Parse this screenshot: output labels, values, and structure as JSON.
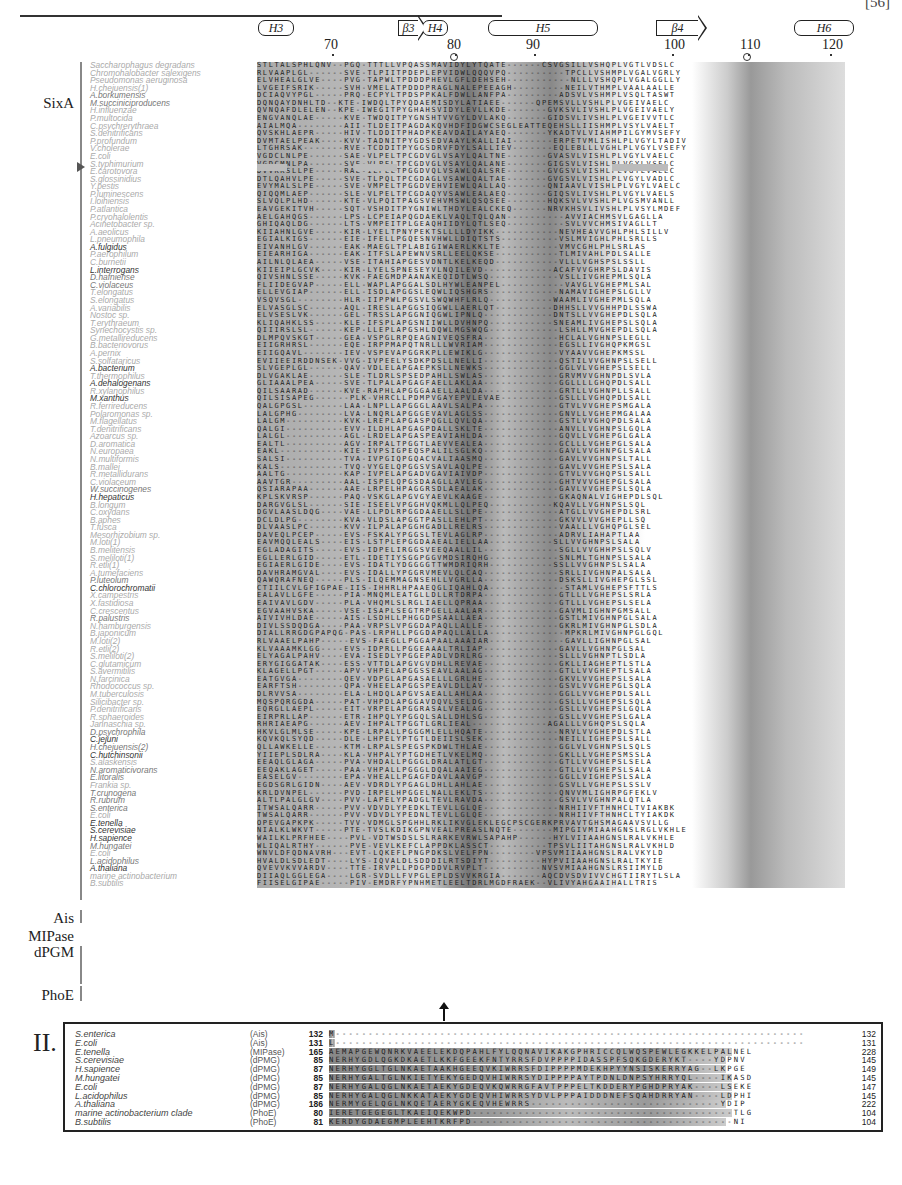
{
  "header": {
    "journal_code": "[56]"
  },
  "secondary_structure": [
    {
      "label": "H3",
      "type": "helix",
      "x": 258,
      "w": 36
    },
    {
      "label": "β3",
      "type": "strand",
      "x": 398,
      "w": 20
    },
    {
      "label": "H4",
      "type": "helix",
      "x": 422,
      "w": 26
    },
    {
      "label": "H5",
      "type": "helix",
      "x": 488,
      "w": 110
    },
    {
      "label": "β4",
      "type": "strand",
      "x": 656,
      "w": 42
    },
    {
      "label": "H6",
      "type": "helix",
      "x": 794,
      "w": 60
    }
  ],
  "ruler": [
    {
      "label": "70",
      "x": 332
    },
    {
      "label": "80",
      "x": 455
    },
    {
      "label": "90",
      "x": 534
    },
    {
      "label": "100",
      "x": 672
    },
    {
      "label": "110",
      "x": 748
    },
    {
      "label": "120",
      "x": 830
    }
  ],
  "markers": {
    "ring_positions": [
      452,
      745
    ],
    "highlight_row_species": "E.coli",
    "arrow_position": "between panels at residue ~80"
  },
  "groups": [
    {
      "label": "SixA",
      "top": 95
    },
    {
      "label": "Ais",
      "top": 910
    },
    {
      "label": "MIPase",
      "top": 928
    },
    {
      "label": "dPGM",
      "top": 944
    },
    {
      "label": "PhoE",
      "top": 987
    }
  ],
  "species": [
    {
      "name": "Saccharophagus degradans",
      "tone": "lt",
      "seq": "STLTALSPHLQNV--PGQ-TTTLLVPQASSMAVIDYLYTQATE------CSVGSILLVSHQPLVGTLVDSLC"
    },
    {
      "name": "Chromohalobacter salexigens",
      "tone": "lt",
      "seq": "RLVAAPLGL------SVE-TLPIITPDEPLEPVIDWLQQQVPQ----------TPCLLVSHMPLVGALVGRLY"
    },
    {
      "name": "Pseudomonas aeruginosa",
      "tone": "lt",
      "seq": "ELVHEALGLVE----PVG-TAPWLTPDDDPHEVLGFLDEHSEH-----------NLLLVSHQPLVGALGGLLY"
    },
    {
      "name": "H.chejuensis(1)",
      "tone": "lt",
      "seq": "LVGEIFSRIK-----SVH-VMELATPDDDPRAGLNALEPEEAGH---------NEILVTHMPLVAALAALLE"
    },
    {
      "name": "A.borkumensis",
      "tone": "md",
      "seq": "DCIAQVYPGL-----PRQ-ECPYLTPDSPPKALFDWLLANFPA---------ADSVLVSHMPLVSQLTASWT"
    },
    {
      "name": "M.succiniciproducens",
      "tone": "md",
      "seq": "DQNQAYDNHLTD--KTE-IWDQLTPYQDAEMISDYLATIAEE------QPEMSVLLVSHLPLVGEIVAELC"
    },
    {
      "name": "H.influenzae",
      "tone": "lt",
      "seq": "QVNQAFDLELEN--KPE-IWEGITPYGHAHSVIDYLEVLLKDE-------GVKSVLIVSHLPLVGEIVAELY"
    },
    {
      "name": "P.multocida",
      "tone": "lt",
      "seq": "ENGVANQLAE-----KVE-TWDQITPYGNSHTVVGYLDVLAKQ-------GIDSVLIVSHLPLVGEIVVTLC"
    },
    {
      "name": "C.psychrerythraea",
      "tone": "lt",
      "seq": "AIALMQA--------AII-TLDEITPAGDAKQVHDFIDGWCSEGLEATTEQEHSLLIISHMPLVSYLVAELT"
    },
    {
      "name": "S.denitrificans",
      "tone": "lt",
      "seq": "QVSKHLAEPR-----HIV-TLDDITPHADPKEAVDAILAYAEQ-------YKADTVLVIAHMPILGYMVSEFY"
    },
    {
      "name": "P.profundum",
      "tone": "lt",
      "seq": "DVMTAELPEAK----KVV-TADNITPYGDSEDVAAYLKALLIAI-------ERPETVMLISHLPLVGYLTADIV"
    },
    {
      "name": "V.cholerae",
      "tone": "lt",
      "seq": "LTGHRSAK-------RVE-TCDDITPYGGSDRVFDYLSALLIEV-------EQLEBLLLVGHLPLVGYLVSEFY"
    },
    {
      "name": "E.coli",
      "tone": "lt",
      "seq": "VGDCLNLPE------SAE-VLPELTPCGDVGLVSAYLQALTNE-------GVASVLVISHLPLVGYLVAELC"
    },
    {
      "name": "S.typhimurium",
      "tone": "lt",
      "seq": "VGDCMNLPA------SVE-VLPELTPCGDVGLVSAYLQALANE-------GIGSVLVISHLPLVGYLVSELC"
    },
    {
      "name": "E.carotovora",
      "tone": "lt",
      "seq": "DVVKKSLLPE-----RAE-ILPELTPGGDVQLVSAWLQALSRE-------GVGSVLVISHLPLVGYLVAELC"
    },
    {
      "name": "S.glossinidius",
      "tone": "lt",
      "seq": "DTLQAHVLPE-----SVE-TLPQLTPCGDAGLVSAWLQALTAE-------GVGSVLVISHLPLVGYLVADLC"
    },
    {
      "name": "Y.pestis",
      "tone": "lt",
      "seq": "EVYMALSLPE-----SVE-VMPELTPGGDVEHVIEWLQALLAQ-------QNIAAVLVISHLPLVGYLVAELC"
    },
    {
      "name": "P.luminescens",
      "tone": "lt",
      "seq": "QIQQMLAEP------SLE-VLPELTPCGDAQYVSAWLEALAEQ-------GIQSVLIVSHLPLVGYLVAELS"
    },
    {
      "name": "I.loihiensis",
      "tone": "lt",
      "seq": "SLVQLPLHD------KTE-VLPQITPAGSVEHVMSWLQSQSEE-------HQKSVLVVSHLPLVGSMVANLL"
    },
    {
      "name": "P.atlantica",
      "tone": "lt",
      "seq": "EAVGEKITVH-----SQT-VSHDITPYGNIWLTHDYLEALCKEQ------NRVKHSVLIVSHLPLVSYLMDEF"
    },
    {
      "name": "P.cryohalolentis",
      "tone": "lt",
      "seq": "AELGAHQGS------LPS-LCPEIAPQGDAEKLVAQLTQLQAN----------AVVIACHMSVLGAGLLA"
    },
    {
      "name": "Acinetobacter sp.",
      "tone": "lt",
      "seq": "GHIQAQLDG------LTS-VMPEITPLGEAQHIIDYLQTLSEQ----------SVLVVCHMSIVAGLLT"
    },
    {
      "name": "A.aeolicus",
      "tone": "lt",
      "seq": "KIIAHNLGVE-----KIR-LYELTPNYPEKTSLLLLDYIKK-----------NEVHEAVVGHLPHLSILLV"
    },
    {
      "name": "L.pneumophila",
      "tone": "lt",
      "seq": "EGIALKIGS------EIE-IFELLPGQESNVHWLLDIQTSTS----------VSLMVIGHLPHLSRLLS"
    },
    {
      "name": "A.fulgidus",
      "tone": "dk",
      "seq": "EIVANHLGV------EAK-MAEGLTPLABIGIWAERLKKLTE----------VMVCGHLPHLSRLAS"
    },
    {
      "name": "P.aerophilum",
      "tone": "lt",
      "seq": "EIEARHIGA------EAK-ITFSLAPEWNVSRLLEELQKSE-----------TLMIVAHLPDLSALLE"
    },
    {
      "name": "C.burnetii",
      "tone": "lt",
      "seq": "AILNLQLAEA-----VSE-ITAHIAPGESVDNTLKELKEQD-----------VLLLVGHSPSLSSLL"
    },
    {
      "name": "L.interrogans",
      "tone": "dk",
      "seq": "KIIEIPLGCVK----KIR-LYELSPNESEYVLNQILEVD------------ACAFVVGHRPSLDAVIS"
    },
    {
      "name": "D.hafniense",
      "tone": "md",
      "seq": "QIVSHNLSSE-----KVK-FAEGMDPAANAKEQIDTLWSQ------------VSLLIVGHEPMLSQLA"
    },
    {
      "name": "C.violaceus",
      "tone": "md",
      "seq": "FLIIDEGVAP-----ELL-WAPLAPGGALSDLHYWLEANPEL-----------VAVGLVGHEPMLSAL"
    },
    {
      "name": "T.elongatus",
      "tone": "lt",
      "seq": "ELLEVGIAP------ELL-ISDLAPGGSLEQWLIQSHGRS------------NAMAVIGHEPSLGLLV"
    },
    {
      "name": "S.elongatus",
      "tone": "lt",
      "seq": "VSQVSGL--------HLR-IIPPWLPGSVLSWQWHFLRLQ-----------WAAMLIVGHEPMLSQLA"
    },
    {
      "name": "A.variabilis",
      "tone": "lt",
      "seq": "ELVASGLSC------AQL-IRESLAPGGSIQGWLLAERLQT----------DHHSLLVVGHHPDLSSWA"
    },
    {
      "name": "Nostoc sp.",
      "tone": "lt",
      "seq": "ELVSESLVK------GEL-TRSSLAPGGNIQGWLIPNLQ------------DNTSLLVVGHEPDLSQLA"
    },
    {
      "name": "T.erythraeum",
      "tone": "lt",
      "seq": "KLIQAHKLSS-----KLE-IFSPLAPGSNIIWLLDVHNPQ-----------SNEAMLIVGHEPSLSQLA"
    },
    {
      "name": "Synechocystis sp.",
      "tone": "lt",
      "seq": "QIIIRSLSL------KEP-LLEPLAPGSHLDQWLMGSWQG------------LSHLLMVGHEPDLSQLA"
    },
    {
      "name": "G.metallireducens",
      "tone": "lt",
      "seq": "DLMPQVSKGT-----GEA-VSPGLRPQEAGNIVEQSFRA-------------HCLALVGHNPSLEGLL"
    },
    {
      "name": "B.bacteriovorus",
      "tone": "lt",
      "seq": "EIIGRHRSL------EQE-IRPPMAPQTNRLLLWVRIAM-------------EGSLLIVGHQPKMGSL"
    },
    {
      "name": "A.pernix",
      "tone": "lt",
      "seq": "EIIGQAVL-------IEV-VSPEVAPGGRKPLLEWIKLG-------------VYAAVVGHEPKMSSL"
    },
    {
      "name": "S.solfataricus",
      "tone": "lt",
      "seq": "EVIIEEIRDDNSEK-VVG-IVPEELYSDKPDSLLNELLI-------------QSTILVVGHNPSLSELL"
    },
    {
      "name": "A.bacterium",
      "tone": "dk",
      "seq": "SLVGEPLGL------QAV-VDLELAPGAEPKSLLNEWKS-------------GGLVLVGHEPSLSELL"
    },
    {
      "name": "T.thermophilus",
      "tone": "lt",
      "seq": "DLVGAKLAE------SLE-TLDRLSPSEDPAHLLSWLAS-------------GRVMVVGHNPDLSVLA"
    },
    {
      "name": "A.dehalogenans",
      "tone": "dk",
      "seq": "GLIAAALPEA-----SVE-TLPALAPGAGFAELLAKLAA-------------GGLLLLGHQPDLSALL"
    },
    {
      "name": "R.xylanophilus",
      "tone": "lt",
      "seq": "QILSAARAD------KVE-RAPHLAPGGGAAELLAALDA-------------GRTLLVGHNPLLSALL"
    },
    {
      "name": "M.xanthus",
      "tone": "dk",
      "seq": "QILSISAPEG------PLK-VHRCLLPDMPVGAYEPVLEVAE----------GSLLLVGHQPDLSALL"
    },
    {
      "name": "R.ferrireducens",
      "tone": "lt",
      "seq": "QALGPGSL-------LAA-LNPLLAPGGGLAAVLSALPA-------------GTVLVVGHEPSMGALA"
    },
    {
      "name": "Polaromonas sp.",
      "tone": "lt",
      "seq": "LALGPHG--------LVA-LNQRLAPGGGEVAVLAGLSS-------------GNVLLVGHEPMGALAA"
    },
    {
      "name": "M.flagellatus",
      "tone": "lt",
      "seq": "LALGM----------KVK-LREPLAPGASPQGLLQVLQA-------------GSTLVVGHQPDLSALA"
    },
    {
      "name": "T.denitrificans",
      "tone": "lt",
      "seq": "QALGI----------EVV-ILDHLAPGAGPDALLSKLTE-------------ANVLLVGHNPSLGQLA"
    },
    {
      "name": "Azoarcus sp.",
      "tone": "lt",
      "seq": "LALGL----------AGL-LRDELAPGASPEAVIAHLDA-------------GQVLLVGHEPGLGALA"
    },
    {
      "name": "D.aromatica",
      "tone": "lt",
      "seq": "EALTL----------AGV-IRPALTPGGTLAEVVEALEA-------------GCLLLVGHEPGLSALA"
    },
    {
      "name": "N.europaea",
      "tone": "lt",
      "seq": "EAKL-----------KIE-IVPSIGPEQSPALILSGLKQ-------------GAVLVVGHNPGLSALA"
    },
    {
      "name": "N.multiformis",
      "tone": "lt",
      "seq": "SALSI----------TVA-IVPGIQPGQACVALIAASMQ-------------GAVLVVGHNPSLTALL"
    },
    {
      "name": "B.mallei",
      "tone": "lt",
      "seq": "KALS-----------TVQ-VYGELQPGGSVSAVLAQLPE-------------GAVLVVGHEPSLSALA"
    },
    {
      "name": "R.metallidurans",
      "tone": "lt",
      "seq": "AALTG----------KAP-IVPELAPGADVGAVIAIVDP-------------GTVLVVGHQPSLSALL"
    },
    {
      "name": "C.violaceum",
      "tone": "lt",
      "seq": "AAVTGR---------AAL-ISPELQPGSDAAGLLAVLEG-------------GHTVVVGHEPGLSALA"
    },
    {
      "name": "W.succinogenes",
      "tone": "md",
      "seq": "QSIARAPAA------AAE-LRPELHPAGGRSDLAEALAK-------------GAVLVVGHEPSLSQLA"
    },
    {
      "name": "H.hepaticus",
      "tone": "dk",
      "seq": "KPLSKVRSP------PAQ-VSKGLAPGVGYAEVLKAAGE-------------GKAQNALVIGHEPDLSQL"
    },
    {
      "name": "B.longum",
      "tone": "lt",
      "seq": "DARGVGLSL------SIE-ISEELVPGGHVQKMLLQLPEQ-----------KQAVLLVGHNPSLSQL"
    },
    {
      "name": "C.oxydans",
      "tone": "lt",
      "seq": "DGVLAASLDQG----VAE-LLPDLRPGGDAAELLSLLPE-------------ATGLLVVGHEPDLSRL"
    },
    {
      "name": "B.aphes",
      "tone": "lt",
      "seq": "DCLDLPG--------KVA-VLDSLAPGGTPASLLEHLPT-------------GKVVLVVGHEPLLSQ"
    },
    {
      "name": "T.fusca",
      "tone": "lt",
      "seq": "DLVAASLPC------KVV-ILPALAPGGHGADLLRELRS-------------VAALLLVGHQPGLSEL"
    },
    {
      "name": "Mesorhizobium sp.",
      "tone": "lt",
      "seq": "DAVEQLPCEP-----EVS-FSKALYPGGSLTEVLAGLRP-------------ADRVLIAHAPTLAA"
    },
    {
      "name": "M.loti(1)",
      "tone": "lt",
      "seq": "EAVMQQLEALS----EIS-LSTPLEPGGDAAEALIELLAA-----------SLLVVGHNPSLSALA"
    },
    {
      "name": "B.melitensis",
      "tone": "lt",
      "seq": "EGLADAGITS-----EVS-IDPELIRGGSVEEQAALLIL-------------SGLLVVGHHPSLSQLV"
    },
    {
      "name": "S.meliloti(1)",
      "tone": "lt",
      "seq": "EGLLERLGID-----ETL-IDETIYSGGPGGVMDSIRQHG------------SNLMLTGHNPSLSALA"
    },
    {
      "name": "R.etli(1)",
      "tone": "lt",
      "seq": "EGIAERLGIDE----EVS-IDATLYDGGGGTTWMDRIQRH-----------SSLLVVGHNPSLSALA"
    },
    {
      "name": "A.tumefaciens",
      "tone": "lt",
      "seq": "DAVHRAMGVAL----EVS-IDALLYPGGRVMEVLQLCAQ-------------SRLLIVGHNPALSALA"
    },
    {
      "name": "P.luteolum",
      "tone": "md",
      "seq": "QAWQRAFNEQ-----PLS-ILQEMMAGNSEHLLVGRLLA-------------DSKSLLIVGHEPGLSSL"
    },
    {
      "name": "C.chlorochromatii",
      "tone": "dk",
      "seq": "CTIILCVLGFIGPAE-IIS-IHHRLHPAAEQGLIQAHLQA-------------STAMLVGHEPSFTTLS"
    },
    {
      "name": "X.campestris",
      "tone": "lt",
      "seq": "EALAVLLGFE-----PIA-MNQMLEATGLLDLLRTDRPA-------------GTLLLVGHEPSLSRLA"
    },
    {
      "name": "X.fastidiosa",
      "tone": "lt",
      "seq": "EAIVAVLGDV-----PLA-VHQMLSLRGLIAELLQPRAA-------------GTLLLVGHEPSLSELA"
    },
    {
      "name": "C.crescentus",
      "tone": "lt",
      "seq": "EGVAAHVSKA-----VSE-ISAPLSEGTRPGELLAALAR-------------GAVMLIGHNPGMSALL"
    },
    {
      "name": "R.palustris",
      "tone": "md",
      "seq": "AIVIVHLDAE-----AIS-LSDHLLPHGGDPSAALLAEA-------------GSTLMIVGHNPGLSALA"
    },
    {
      "name": "N.hamburgensis",
      "tone": "lt",
      "seq": "DIVLSSDQDGA----PAA-VRPSLVPGGDAPAQLLALLE-------------GKRLMIVGHNPGLSDLA"
    },
    {
      "name": "B.japonicum",
      "tone": "lt",
      "seq": "DIALLRRGDGPAPQG-PAS-LRPHLLPGGDAPAQLLALLA-------------MPKRLMIVGHNPGLGQL"
    },
    {
      "name": "M.loti(2)",
      "tone": "lt",
      "seq": "RLVAAELPAHP-----EVS-FAEGLLPGGAPAALAAAIAR-------------GAVLLIGHNPGLSAL"
    },
    {
      "name": "R.etli(2)",
      "tone": "lt",
      "seq": "KLVAAAMKLGG----EVS-IDPRLLPGGEAAALTRLIAP-------------GAVLLVGHNPGLSAL"
    },
    {
      "name": "S.meliloti(2)",
      "tone": "lt",
      "seq": "ELYAGALPAHV----EVA-ISEDLYPGGEPADLVDRLRG-------------SLLLVGHNPTLSDLA"
    },
    {
      "name": "C.glutamicum",
      "tone": "lt",
      "seq": "ERYGIGGATAK----ESS-VTTDLAPGVGVDHLLREVAE-------------GKLLIAGHEPTLSTLA"
    },
    {
      "name": "S.avermitilis",
      "tone": "lt",
      "seq": "KLAGELLPGT-----APV-VHPELAPGGSSEAVLAALAG-------------GTLLVVGHEPTLSALA"
    },
    {
      "name": "N.farcinica",
      "tone": "lt",
      "seq": "EATGVGA--------QEV-VDPGLAPGASAELLLGRLHE-------------GKVLVVGHEPSLSALA"
    },
    {
      "name": "Rhodococcus sp.",
      "tone": "lt",
      "seq": "EARFTSH--------QPA-VHEELAPGGSPEAVLDLLAV-------------GSVLVVGHEPGLSQLA"
    },
    {
      "name": "M.tuberculosis",
      "tone": "lt",
      "seq": "DLRVVSA--------ELA-LHDQLAPGVSAEALLAHLAA-------------GGLLVVGHEPDLSALL"
    },
    {
      "name": "Silicibacter sp.",
      "tone": "lt",
      "seq": "MQSPQRGGDA-----PAT-VHPDLAPGGAVDQVLSELDG-------------GSLLLVGHEPSLSQLA"
    },
    {
      "name": "P.denitrificans",
      "tone": "lt",
      "seq": "EQRGLLAEPL-----EIT-VRPELAPGGRASALVEALAG-------------GSLLVVGHEPSLGQLA"
    },
    {
      "name": "R.sphaeroides",
      "tone": "lt",
      "seq": "EIRPRLLAP------ETR-IHPQLYPGGQLSALLDHLSG-------------GSLLVVGHEPSLGALA"
    },
    {
      "name": "Jannaschia sp.",
      "tone": "lt",
      "seq": "RHRIAEAPG------AEV-IHPALTPGGTLGRLIEAL-------------AGALLLVGHQPSLSQLA"
    },
    {
      "name": "D.psychrophila",
      "tone": "md",
      "seq": "HKVLGLMLSE-----KPE-LRPALLPGGGMLELLHQATE-------------NRVLVVGHEPDLSTLA"
    },
    {
      "name": "C.jejuni",
      "tone": "dk",
      "seq": "KQVKQLSYQD-----DLE-LHPELYPTGTLDEIISLSEK-------------NEILLIGHEPSLSALL"
    },
    {
      "name": "H.chejuensis(2)",
      "tone": "md",
      "seq": "QLLAWKELLE-----KTM-LRPALSPEGSPKDWLTHLAE-------------GGLVLVGHNPSLSQLS"
    },
    {
      "name": "C.hutchinsonii",
      "tone": "dk",
      "seq": "YIIEPLSDLRA----KLA-VHPALYPTGDHETLVKELMQ-------------GKLLLVGHEPSMSSLA"
    },
    {
      "name": "S.alaskensis",
      "tone": "lt",
      "seq": "EEAQLGLAGA-----PVA-VHDALLPGGGLDRALATLGT-------------GTLLVVGHEPSLSELA"
    },
    {
      "name": "N.aromaticivorans",
      "tone": "md",
      "seq": "EEQAKLAGET-----PAA-VHPALLPGGGLDQALAAIEG-------------GTLLVVGHEPSLSALA"
    },
    {
      "name": "E.litoralis",
      "tone": "md",
      "seq": "EASELGV--------EPA-VHEALLPGAGFDAVLAAVGP-------------GGLLVIGHEPSLSALA"
    },
    {
      "name": "Frankia sp.",
      "tone": "lt",
      "seq": "EGDSGRLGIDN----AEV-VDRDLYPGAGLDHLLAHLAE-------------GSVLLVGHEPSLSSLV"
    },
    {
      "name": "T.crunogena",
      "tone": "md",
      "seq": "KRLDVNPEL------PVD-IRPELHPGGELNALLEKLTS-------------QNVVMLIGHRPGFEKLV"
    },
    {
      "name": "R.rubrum",
      "tone": "md",
      "seq": "ALTLPALGLGV----PVV-LAPELYPADGLTEVLRAVDA-------------GSVLVVGHNPALQTLA"
    },
    {
      "name": "S.enterica",
      "tone": "md",
      "seq": "ITWSALQARR-----PVV-VDVDLYPEDKLTEVLLGLQE-------------NRHIIVFTHNHCLTVIAKBK"
    },
    {
      "name": "E.coli",
      "tone": "lt",
      "seq": "TWSALQARR------PVV-VDVDLYPEDNLTEVLLGLQE-------------NRHIIVFTHNHCLTYIAKDK"
    },
    {
      "name": "E.tenella",
      "tone": "dk",
      "seq": "OPEVGAPKPK-----TVV-VDMGLSPGHHLRKLIKVGLEKLEGCPSCGERKPRVAVTGHSMAGAAVSVLLG"
    },
    {
      "name": "S.cerevisiae",
      "tone": "dk",
      "seq": "NIALKLWKVT-----PTE-TVSLKDIKGPNVEALPREASLNQTE-------MIPGIVMIAAHGNSLRGLVKHLE"
    },
    {
      "name": "H.sapience",
      "tone": "dk",
      "seq": "WAILKLPRFHEE----PVL-VDTWSDSLSLRARKEVRWLSAPAHP------HYLVIIAAHGNSLRALVKHLE"
    },
    {
      "name": "M.hungatei",
      "tone": "md",
      "seq": "WLIQALRTHY------PVE-VEVLKEFCLAPPDKLASSCT----------TPSVLIITAHGNSLRALVKHLD"
    },
    {
      "name": "E.coli",
      "tone": "lt",
      "seq": "WNVLDFQDNAVRH---EVT-LQKEFLPNGPDKSLVELFPN--------VPSVMIIAAHGNSLRALVKYLD"
    },
    {
      "name": "L.acidophilus",
      "tone": "md",
      "seq": "HVALDLSDLEDT----LYS-IQVALDLSDDDILRTSDIYT---------HYPVIIAAHGNSLRALTKYIE"
    },
    {
      "name": "A.thaliana",
      "tone": "dk",
      "seq": "QVEVVKVVARDV----TTE-IRVPLLPDGPDDVLRVPLT----------NVSVMIAAHGNSLRSIIMYLD"
    },
    {
      "name": "marine actinobacterium",
      "tone": "lt",
      "seq": "DIIAQLGGLEGA----LGR-SVDLLFVPGLEPLDSVVKRGIA-------AQCDVSDVIVVCHGTIIRYTLSLA"
    },
    {
      "name": "B.subtilis",
      "tone": "lt",
      "seq": "FIISELGIPAE-----PIV-EMDRFYPNHMETLEELTDRLMGDFRAEK--VLIVYAHGAAIHALLTRIS"
    }
  ],
  "panel2": {
    "label": "II.",
    "rows": [
      {
        "species": "S.enterica",
        "family": "(Ais)",
        "start": "132",
        "seq": "M------------------------------------------------------------------------",
        "end": "132"
      },
      {
        "species": "E.coli",
        "family": "(Ais)",
        "start": "131",
        "seq": "L------------------------------------------------------------------------",
        "end": "131"
      },
      {
        "species": "E.tenella",
        "family": "(MIPase)",
        "start": "165",
        "seq": "AEMAPGEWQNRKVAEELEKDQPAHLFYLQQNAVIKAKGPHRICCQLWQSPEWLEGKKELPALNEL",
        "end": "228"
      },
      {
        "species": "S.cerevisiae",
        "family": "(dPMG)",
        "start": "85",
        "seq": "NERHYGDLQGKDKAETLKKFGEEKFNTYRRSFDVPPPPIDASSPFSQKGDERYKT----YDPNV",
        "end": "145"
      },
      {
        "species": "H.sapience",
        "family": "(dPMG)",
        "start": "87",
        "seq": "NERHYGGLTGLNKAETAAKHGEEQVKIWRRSFDIPPPPMDEKHPYYNSISKERRYAG--LKPGE",
        "end": "149"
      },
      {
        "species": "M.hungatei",
        "family": "(dPMG)",
        "start": "85",
        "seq": "NERHYGALTGLNKIETYEKYGEDQVHIWRRSYDIPPPPAYTPDNLDNPSYHRRYQL----IKASD",
        "end": "145"
      },
      {
        "species": "E.coli",
        "family": "(dPMG)",
        "start": "87",
        "seq": "NERHYGALQGLNKAETAEKYGDEQVKQWRRGFAVTPPPELTKDDERYPGHDPRYAK----LSEKE",
        "end": "147"
      },
      {
        "species": "L.acidophilus",
        "family": "(dPMG)",
        "start": "85",
        "seq": "NERHYGALQGLNKKATAEKYGDEQVHIWRRSYDVLPPPAIDDDNEFSQAHDRRYAN----LDPHI",
        "end": "145"
      },
      {
        "species": "A.thaliana",
        "family": "(dPMG)",
        "start": "186",
        "seq": "NERMYGELQGLNKQETAERYGKEQVHEWRRS-----------------------------YDIP",
        "end": "222"
      },
      {
        "species": "marine actinobacterium clade",
        "family": "(PhoE)",
        "start": "80",
        "seq": "IERETGEGEGLTKAEIQEKWPD----------------------------------------TLG",
        "end": "104"
      },
      {
        "species": "B.subtilis",
        "family": "(PhoE)",
        "start": "81",
        "seq": "KERDYGDAEGMPLEEHTKRFPD----------------------------------------NI",
        "end": "104"
      }
    ]
  }
}
